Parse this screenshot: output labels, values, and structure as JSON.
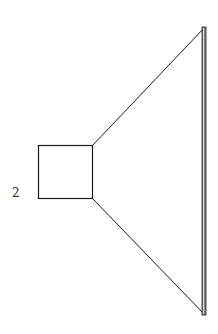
{
  "diagram": {
    "title": "",
    "node_label": "2",
    "colors": {
      "stroke": "#1a1a1a",
      "bar_fill": "#8a8a8a",
      "background": "#ffffff"
    },
    "shapes": {
      "square": {
        "x": 38,
        "y": 145,
        "width": 54,
        "height": 53
      },
      "cone_top_line": {
        "x1": 92,
        "y1": 145,
        "x2": 205,
        "y2": 27
      },
      "cone_bottom_line": {
        "x1": 92,
        "y1": 198,
        "x2": 205,
        "y2": 315
      },
      "right_bar": {
        "x": 202,
        "y": 27,
        "width": 4,
        "height": 288
      }
    }
  }
}
